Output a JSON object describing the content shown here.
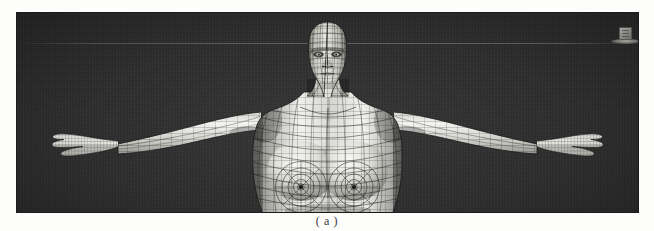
{
  "figure": {
    "caption": "( a )",
    "panel_label": "a",
    "pose": "t-pose",
    "view": "front-orthographic"
  },
  "viewport": {
    "background_color": "#2c2c2c",
    "horizon_color": "#848484",
    "mesh_line_color": "#1c1c1c",
    "mesh_surface_light": "#f2f2ee",
    "mesh_surface_mid": "#bdbdb8",
    "mesh_surface_dark": "#6b6b68",
    "border_color": "#1a1a1a",
    "width": 621,
    "height": 199
  },
  "scene_prop": {
    "name": "reference-cube",
    "cube_color": "#c6c6c2",
    "base_color": "#9a9a96"
  },
  "model_parts": [
    {
      "name": "head",
      "label": "head"
    },
    {
      "name": "neck",
      "label": "neck"
    },
    {
      "name": "torso",
      "label": "torso"
    },
    {
      "name": "left-arm",
      "label": "left arm"
    },
    {
      "name": "right-arm",
      "label": "right arm"
    },
    {
      "name": "left-hand",
      "label": "left hand"
    },
    {
      "name": "right-hand",
      "label": "right hand"
    },
    {
      "name": "pelvis",
      "label": "pelvis"
    }
  ]
}
